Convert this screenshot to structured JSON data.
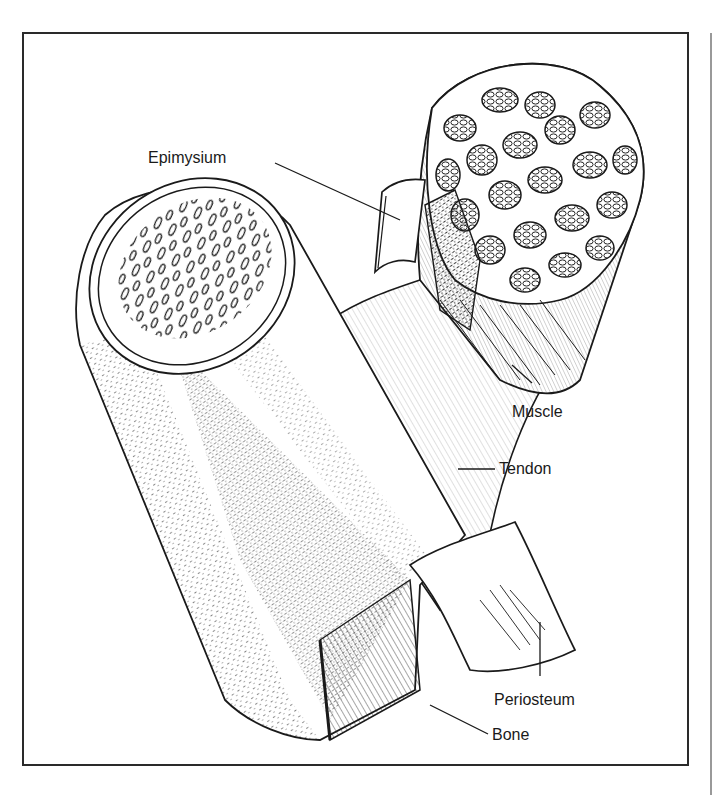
{
  "figure": {
    "frame": {
      "x": 23,
      "y": 33,
      "width": 665,
      "height": 732,
      "stroke": "#2a2a2a"
    },
    "ink_color": "#1a1a1a",
    "background": "#ffffff",
    "labels": [
      {
        "id": "epimysium",
        "text": "Epimysium",
        "x": 148,
        "y": 150
      },
      {
        "id": "muscle",
        "text": "Muscle",
        "x": 512,
        "y": 404
      },
      {
        "id": "tendon",
        "text": "Tendon",
        "x": 499,
        "y": 451
      },
      {
        "id": "periosteum",
        "text": "Periosteum",
        "x": 494,
        "y": 692
      },
      {
        "id": "bone",
        "text": "Bone",
        "x": 492,
        "y": 728
      }
    ]
  }
}
